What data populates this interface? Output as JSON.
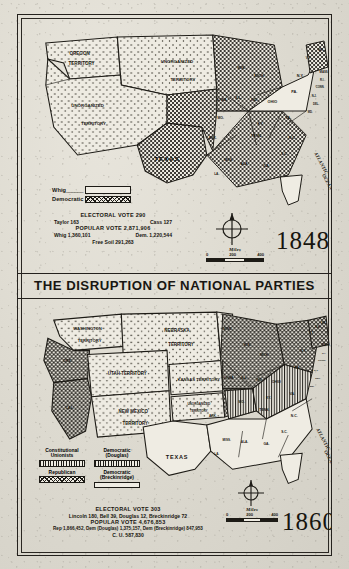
{
  "document": {
    "title": "The Disruption of National Parties",
    "banner_text": "THE DISRUPTION OF NATIONAL PARTIES",
    "paper_color": "#ded9cf",
    "ink_color": "#17150f"
  },
  "map1848": {
    "year": "1848",
    "legend": [
      {
        "label": "Whig",
        "lead": "______",
        "pattern": "plain"
      },
      {
        "label": "Democratic",
        "lead": "",
        "pattern": "crosshatch"
      }
    ],
    "stats": {
      "electoral_heading": "ELECTORAL VOTE 290",
      "electoral_left": "Taylor  163",
      "electoral_right": "Cass  127",
      "popular_heading": "POPULAR VOTE 2,871,906",
      "popular_left": "Whig  1,360,101",
      "popular_right": "Dem. 1,220,544",
      "popular_third": "Free Soil  291,263"
    },
    "scale": {
      "caption": "Miles",
      "ticks": [
        "0",
        "200",
        "400"
      ]
    },
    "ocean_label": "ATLANTIC OCEAN",
    "territories": [
      "OREGON TERRITORY",
      "UNORGANIZED TERRITORY",
      "UNORGANIZED TERRITORY"
    ],
    "states": [
      "TEXAS",
      "IOWA",
      "WIS.",
      "ILL.",
      "MICH.",
      "IND.",
      "OHIO",
      "PA.",
      "N.Y.",
      "VT.",
      "ME.",
      "MASS.",
      "R.I.",
      "CONN.",
      "N.J.",
      "DEL.",
      "MD.",
      "VA.",
      "N.C.",
      "S.C.",
      "GA.",
      "ALA.",
      "MISS.",
      "LA.",
      "ARK.",
      "MO.",
      "KY.",
      "TENN.",
      "FLA."
    ]
  },
  "map1860": {
    "year": "1860",
    "legend": [
      {
        "label": "Constitutional Unionists",
        "pattern": "vertical"
      },
      {
        "label": "Democratic (Douglas)",
        "pattern": "vertical"
      },
      {
        "label": "Republican",
        "pattern": "crosshatch"
      },
      {
        "label": "Democratic (Breckinridge)",
        "pattern": "plain"
      }
    ],
    "stats": {
      "electoral_heading": "ELECTORAL VOTE 303",
      "electoral_line": "Lincoln 180,  Bell 39,  Douglas 12,  Breckinridge 72",
      "popular_heading": "POPULAR VOTE 4,676,853",
      "popular_line": "Rep 1,866,452,  Dem (Douglas) 1,375,157, Dem (Breckinridge) 847,953",
      "popular_third": "C. U. 587,830"
    },
    "scale": {
      "caption": "Miles",
      "ticks": [
        "0",
        "200",
        "400"
      ]
    },
    "ocean_label": "ATLANTIC OCEAN",
    "territories": [
      "WASHINGTON TERRITORY",
      "NEBRASKA TERRITORY",
      "UTAH TERRITORY",
      "KANSAS TERRITORY",
      "NEW MEXICO TERRITORY",
      "UNORGANIZED TERRITORY"
    ],
    "states": [
      "ORE.",
      "CAL.",
      "MINN.",
      "IOWA",
      "WIS.",
      "ILL.",
      "MICH.",
      "IND.",
      "OHIO",
      "PA.",
      "N.Y.",
      "VT.",
      "N.H.",
      "ME.",
      "MASS.",
      "R.I.",
      "CONN.",
      "N.J.",
      "DEL.",
      "MD.",
      "VA.",
      "N.C.",
      "S.C.",
      "GA.",
      "ALA.",
      "MISS.",
      "LA.",
      "ARK.",
      "MO.",
      "KY.",
      "TENN.",
      "TEXAS",
      "FLA."
    ]
  }
}
